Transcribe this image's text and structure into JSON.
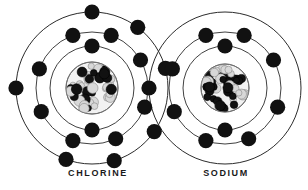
{
  "diagram": {
    "background_color": "#ffffff",
    "ink_color": "#1a1a1a",
    "shell_stroke_color": "#2b2b2b",
    "electron_color": "#111111",
    "nucleus_dark_color": "#111111",
    "nucleus_light_color": "#d8d8d8",
    "atoms": [
      {
        "name": "chlorine",
        "label": "CHLORINE",
        "label_x": 98,
        "label_y": 168,
        "center_x": 92,
        "center_y": 88,
        "nucleus_radius": 26,
        "electron_radius": 7.6,
        "shells": [
          {
            "index": 1,
            "radius": 42,
            "electron_count": 2,
            "angles": [
              270,
              90
            ]
          },
          {
            "index": 2,
            "radius": 56,
            "electron_count": 8,
            "angles": [
              250,
              290,
              330,
              20,
              65,
              110,
              155,
              200
            ]
          },
          {
            "index": 3,
            "radius": 76,
            "electron_count": 7,
            "angles": [
              270,
              307,
              345,
              35,
              73,
              110,
              180
            ]
          }
        ],
        "shell_electron_summary": "2-8-7"
      },
      {
        "name": "sodium",
        "label": "SODIUM",
        "label_x": 226,
        "label_y": 168,
        "center_x": 225,
        "center_y": 88,
        "nucleus_radius": 24,
        "electron_radius": 7.6,
        "shells": [
          {
            "index": 1,
            "radius": 42,
            "electron_count": 2,
            "angles": [
              270,
              90
            ]
          },
          {
            "index": 2,
            "radius": 56,
            "electron_count": 8,
            "angles": [
              250,
              290,
              330,
              20,
              65,
              110,
              155,
              200
            ]
          },
          {
            "index": 3,
            "radius": 76,
            "electron_count": 1,
            "angles": [
              180
            ]
          }
        ],
        "shell_electron_summary": "2-8-1"
      }
    ]
  }
}
